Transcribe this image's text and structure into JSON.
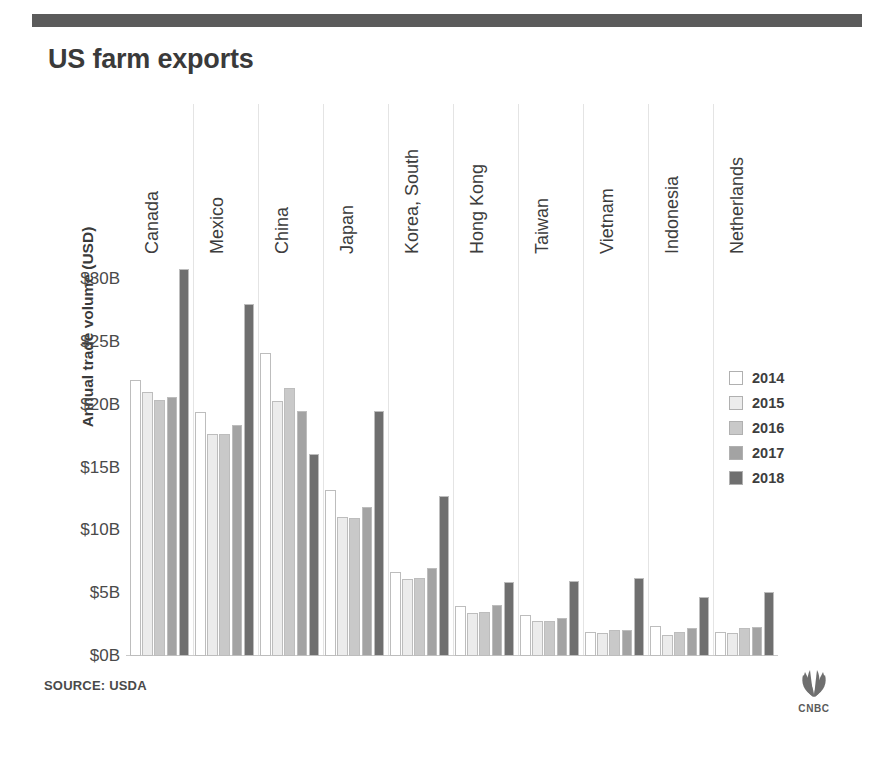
{
  "title": "US farm exports",
  "source_note": "SOURCE: USDA",
  "branding": {
    "logo_name": "cnbc-peacock-logo",
    "wordmark": "CNBC"
  },
  "colors": {
    "top_rule": "#5b5b5b",
    "text": "#3b3b3b",
    "grid": "#e4e4e4",
    "series": [
      "#ffffff",
      "#ececec",
      "#c9c9c9",
      "#a3a3a3",
      "#6f6f6f"
    ]
  },
  "chart_data": {
    "type": "bar",
    "title": "US farm exports",
    "xlabel": "",
    "ylabel": "Annual trade volume (USD)",
    "ylim": [
      0,
      32
    ],
    "ytick_labels": [
      "$0B",
      "$5B",
      "$10B",
      "$15B",
      "$20B",
      "$25B",
      "$30B"
    ],
    "ytick_values": [
      0,
      5,
      10,
      15,
      20,
      25,
      30
    ],
    "grid": false,
    "legend_position": "right",
    "value_unit": "billion USD",
    "categories": [
      "Canada",
      "Mexico",
      "China",
      "Japan",
      "Korea, South",
      "Hong Kong",
      "Taiwan",
      "Vietnam",
      "Indonesia",
      "Netherlands"
    ],
    "series": [
      {
        "name": "2014",
        "color": "#ffffff",
        "values": [
          22.0,
          19.4,
          24.1,
          13.2,
          6.7,
          4.0,
          3.3,
          1.9,
          2.4,
          1.9
        ]
      },
      {
        "name": "2015",
        "color": "#ececec",
        "values": [
          21.0,
          17.7,
          20.3,
          11.1,
          6.1,
          3.4,
          2.8,
          1.8,
          1.7,
          1.8
        ]
      },
      {
        "name": "2016",
        "color": "#c9c9c9",
        "values": [
          20.4,
          17.7,
          21.3,
          11.0,
          6.2,
          3.5,
          2.8,
          2.1,
          1.9,
          2.2
        ]
      },
      {
        "name": "2017",
        "color": "#a3a3a3",
        "values": [
          20.6,
          18.4,
          19.5,
          11.9,
          7.0,
          4.1,
          3.0,
          2.1,
          2.2,
          2.3
        ]
      },
      {
        "name": "2018",
        "color": "#6f6f6f",
        "values": [
          30.8,
          28.0,
          16.1,
          19.5,
          12.7,
          5.9,
          6.0,
          6.2,
          4.7,
          5.1
        ]
      }
    ]
  }
}
